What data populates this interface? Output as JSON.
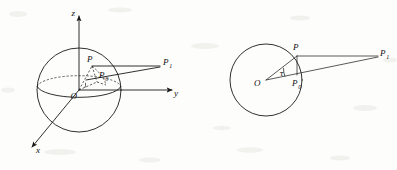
{
  "figure": {
    "background_color": "#fdfdfc",
    "ink_color": "#1a1a1a",
    "panels": [
      {
        "id": "left-panel",
        "name": "three-dimensional-sphere-diagram",
        "description": "Sphere centered at origin O with x, y, z coordinate axes, equatorial ellipse, point P on the sphere surface, projected point P0 and external point P1",
        "axes": [
          {
            "name": "z-axis",
            "label": "z",
            "direction": "up"
          },
          {
            "name": "y-axis",
            "label": "y",
            "direction": "right"
          },
          {
            "name": "x-axis",
            "label": "x",
            "direction": "down-left"
          }
        ],
        "points": [
          {
            "name": "origin",
            "label": "O"
          },
          {
            "name": "point-p",
            "label": "P"
          },
          {
            "name": "point-p0",
            "label": "P",
            "subscript": "0"
          },
          {
            "name": "point-p1",
            "label": "P",
            "subscript": "1"
          }
        ]
      },
      {
        "id": "right-panel",
        "name": "two-dimensional-circle-diagram",
        "description": "Circle centered at O with point P on the circumference, interior point P0, external point P1 and the angle tau at the centre",
        "points": [
          {
            "name": "origin",
            "label": "O"
          },
          {
            "name": "point-p",
            "label": "P"
          },
          {
            "name": "point-p0",
            "label": "P",
            "subscript": "0"
          },
          {
            "name": "point-p1",
            "label": "P",
            "subscript": "1"
          }
        ],
        "angles": [
          {
            "name": "angle-tau",
            "label": "τ"
          }
        ]
      }
    ],
    "labels": {
      "z_axis": "z",
      "y_axis": "y",
      "x_axis": "x",
      "origin": "O",
      "p": "P",
      "p_base": "P",
      "p0_subscript": "0",
      "p1_subscript": "1",
      "tau": "τ"
    }
  }
}
